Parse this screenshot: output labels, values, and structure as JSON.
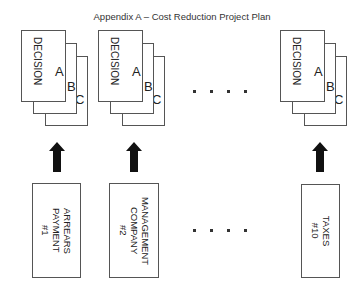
{
  "title": "Appendix A – Cost Reduction Project Plan",
  "decision_stacks": [
    {
      "label": "DECISION",
      "letters": [
        "A",
        "B",
        "C"
      ]
    },
    {
      "label": "DECISION",
      "letters": [
        "A",
        "B",
        "C"
      ]
    },
    {
      "label": "DECISION",
      "letters": [
        "A",
        "B",
        "C"
      ]
    }
  ],
  "sources": [
    {
      "label": "ARREARS\nPAYMENT\n#1"
    },
    {
      "label": "MANAGEMENT\nCOMPANY\n#2"
    },
    {
      "label": "TAXES\n#10"
    }
  ],
  "ellipsis": "....",
  "arrow_icon": "up-arrow-icon",
  "colors": {
    "line": "#555555",
    "arrow": "#111111",
    "text": "#222222"
  }
}
